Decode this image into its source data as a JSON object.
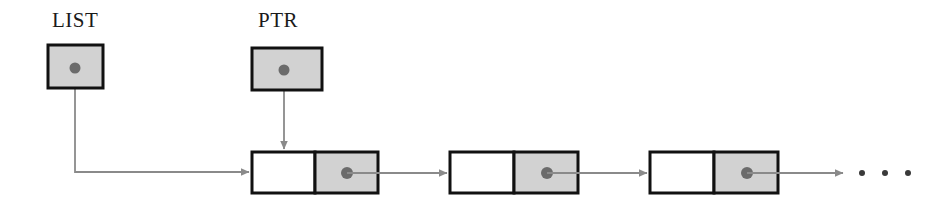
{
  "diagram": {
    "background_color": "#ffffff",
    "colors": {
      "box_border": "#111111",
      "pointer_cell_fill": "#d2d2d2",
      "data_cell_fill": "#ffffff",
      "dot": "#6b6b6b",
      "arrow": "#8a8a8a",
      "text": "#1a1a1a",
      "ellipsis_dot": "#3a3a3a"
    },
    "variables": [
      {
        "id": "list",
        "label": "LIST",
        "label_x": 52,
        "label_y": 8,
        "box": {
          "x": 48,
          "y": 45,
          "w": 55,
          "h": 43
        },
        "dot": {
          "cx": 75,
          "cy": 68,
          "r": 5.5
        },
        "target": "node-1-left-edge"
      },
      {
        "id": "ptr",
        "label": "PTR",
        "label_x": 258,
        "label_y": 8,
        "box": {
          "x": 252,
          "y": 48,
          "w": 70,
          "h": 42
        },
        "dot": {
          "cx": 284,
          "cy": 70,
          "r": 5.5
        },
        "target": "node-1-top-edge"
      }
    ],
    "nodes": [
      {
        "id": "node-1",
        "x": 252,
        "y": 152,
        "w": 126,
        "h": 41,
        "data_cell_w": 63,
        "dot": {
          "cx": 347,
          "cy": 173,
          "r": 6
        }
      },
      {
        "id": "node-2",
        "x": 450,
        "y": 152,
        "w": 128,
        "h": 41,
        "data_cell_w": 64,
        "dot": {
          "cx": 547,
          "cy": 173,
          "r": 6
        }
      },
      {
        "id": "node-3",
        "x": 650,
        "y": 152,
        "w": 128,
        "h": 41,
        "data_cell_w": 64,
        "dot": {
          "cx": 747,
          "cy": 173,
          "r": 6
        }
      }
    ],
    "ellipsis": {
      "dots": [
        {
          "cx": 862,
          "cy": 173,
          "r": 3
        },
        {
          "cx": 885,
          "cy": 173,
          "r": 3
        },
        {
          "cx": 908,
          "cy": 173,
          "r": 3
        }
      ]
    }
  }
}
